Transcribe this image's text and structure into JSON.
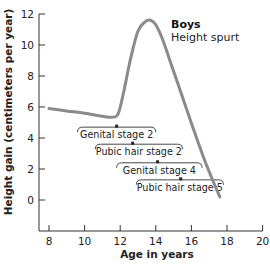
{
  "chart_data": {
    "type": "line",
    "title": "",
    "xlabel": "Age in years",
    "ylabel": "Height gain (centimeters per year)",
    "xlim": [
      8,
      20
    ],
    "ylim": [
      -2,
      12
    ],
    "xticks": [
      8,
      10,
      12,
      14,
      16,
      18,
      20
    ],
    "yticks": [
      0,
      2,
      4,
      6,
      8,
      10,
      12
    ],
    "grid": false,
    "series": [
      {
        "name": "Boys height spurt",
        "color": "#8a8a8a",
        "x": [
          8.0,
          9.0,
          10.0,
          11.0,
          11.6,
          11.9,
          12.2,
          12.6,
          13.0,
          13.4,
          13.7,
          14.0,
          14.4,
          15.0,
          15.6,
          16.2,
          16.8,
          17.3,
          17.6
        ],
        "y": [
          5.9,
          5.75,
          5.6,
          5.4,
          5.35,
          5.6,
          7.0,
          9.2,
          10.9,
          11.5,
          11.6,
          11.3,
          10.3,
          8.3,
          6.3,
          4.3,
          2.4,
          1.0,
          0.2
        ]
      }
    ],
    "annotations": [
      {
        "text": "Boys",
        "x": 15.2,
        "y": 11.5,
        "bold": true
      },
      {
        "text": "Height spurt",
        "x": 15.2,
        "y": 10.6,
        "bold": false
      }
    ],
    "stage_ranges": [
      {
        "label": "Genital stage 2",
        "start": 9.6,
        "end": 14.0,
        "mean": 11.8,
        "y": 4.7
      },
      {
        "label": "Pubic hair stage 2",
        "start": 10.6,
        "end": 15.5,
        "mean": 12.7,
        "y": 3.6
      },
      {
        "label": "Genital stage 4",
        "start": 11.8,
        "end": 16.6,
        "mean": 14.1,
        "y": 2.4
      },
      {
        "label": "Pubic hair stage 5",
        "start": 12.9,
        "end": 17.8,
        "mean": 15.4,
        "y": 1.3
      }
    ]
  },
  "labels": {
    "xlabel": "Age in years",
    "ylabel": "Height gain (centimeters per year)",
    "ann_title": "Boys",
    "ann_sub": "Height spurt"
  }
}
